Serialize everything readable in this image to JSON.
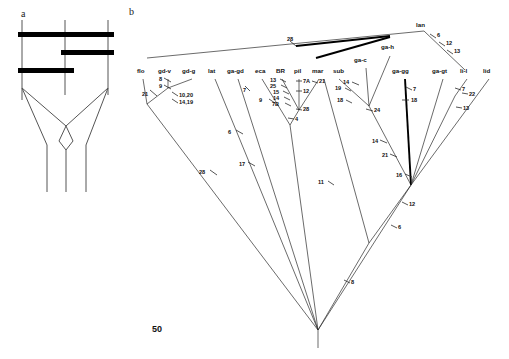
{
  "figure": {
    "panel_a_letter": "a",
    "panel_b_letter": "b",
    "scale_label": "50"
  },
  "panel_a": {
    "description": "three vertical lineage lines joined by three thick horizontal bars with crossing lines below",
    "vertical_lines": [
      {
        "name": "left-lineage",
        "x": 22,
        "y1": 20,
        "y2": 190
      },
      {
        "name": "middle-lineage",
        "x": 65,
        "y1": 20,
        "y2": 190
      },
      {
        "name": "right-lineage",
        "x": 108,
        "y1": 20,
        "y2": 190
      }
    ],
    "horizontal_bars": [
      {
        "name": "top-bar",
        "x1": 18,
        "x2": 112,
        "y": 35,
        "thickness": 6
      },
      {
        "name": "middle-bar",
        "x1": 62,
        "x2": 112,
        "y": 53,
        "thickness": 6
      },
      {
        "name": "bottom-bar",
        "x1": 18,
        "x2": 74,
        "y": 71,
        "thickness": 6
      }
    ]
  },
  "panel_b": {
    "taxa": [
      {
        "id": "flo",
        "label": "flo",
        "x": 141,
        "y": 72
      },
      {
        "id": "gd-v",
        "label": "gd-v",
        "x": 166,
        "y": 72
      },
      {
        "id": "gd-g",
        "label": "gd-g",
        "x": 190,
        "y": 72
      },
      {
        "id": "lat",
        "label": "lat",
        "x": 213,
        "y": 72
      },
      {
        "id": "ga-gd",
        "label": "ga-gd",
        "x": 236,
        "y": 72
      },
      {
        "id": "eca",
        "label": "eca",
        "x": 260,
        "y": 72
      },
      {
        "id": "BR",
        "label": "BR",
        "x": 280,
        "y": 72
      },
      {
        "id": "pil",
        "label": "pil",
        "x": 298,
        "y": 72
      },
      {
        "id": "mar",
        "label": "mar",
        "x": 317,
        "y": 72
      },
      {
        "id": "sub",
        "label": "sub",
        "x": 337,
        "y": 72
      },
      {
        "id": "ga-c",
        "label": "ga-c",
        "x": 360,
        "y": 61
      },
      {
        "id": "ga-h",
        "label": "ga-h",
        "x": 386,
        "y": 48
      },
      {
        "id": "ga-gg",
        "label": "ga-gg",
        "x": 398,
        "y": 72
      },
      {
        "id": "ga-gt",
        "label": "ga-gt",
        "x": 440,
        "y": 72
      },
      {
        "id": "li-l",
        "label": "li-l",
        "x": 465,
        "y": 72
      },
      {
        "id": "lid",
        "label": "lid",
        "x": 487,
        "y": 72
      },
      {
        "id": "lan",
        "label": "lan",
        "x": 421,
        "y": 25
      }
    ],
    "branch_values": [
      {
        "value": "21",
        "x": 146,
        "y": 94
      },
      {
        "value": "8",
        "x": 168,
        "y": 80
      },
      {
        "value": "9",
        "x": 168,
        "y": 87
      },
      {
        "value": "10,20",
        "x": 178,
        "y": 94
      },
      {
        "value": "14,19",
        "x": 178,
        "y": 101
      },
      {
        "value": "28",
        "x": 204,
        "y": 172
      },
      {
        "value": "6",
        "x": 230,
        "y": 131
      },
      {
        "value": "17",
        "x": 241,
        "y": 163
      },
      {
        "value": "7",
        "x": 242,
        "y": 85
      },
      {
        "value": "13",
        "x": 274,
        "y": 80
      },
      {
        "value": "25",
        "x": 274,
        "y": 86
      },
      {
        "value": "15",
        "x": 277,
        "y": 92
      },
      {
        "value": "14",
        "x": 277,
        "y": 98
      },
      {
        "value": "7B",
        "x": 277,
        "y": 104
      },
      {
        "value": "9",
        "x": 263,
        "y": 100
      },
      {
        "value": "7A",
        "x": 303,
        "y": 81
      },
      {
        "value": "21",
        "x": 319,
        "y": 81
      },
      {
        "value": "12",
        "x": 304,
        "y": 91
      },
      {
        "value": "28",
        "x": 302,
        "y": 109
      },
      {
        "value": "4",
        "x": 294,
        "y": 118
      },
      {
        "value": "11",
        "x": 322,
        "y": 182
      },
      {
        "value": "14",
        "x": 348,
        "y": 83
      },
      {
        "value": "19",
        "x": 339,
        "y": 88
      },
      {
        "value": "18",
        "x": 340,
        "y": 101
      },
      {
        "value": "24",
        "x": 375,
        "y": 110
      },
      {
        "value": "14",
        "x": 375,
        "y": 141
      },
      {
        "value": "21",
        "x": 385,
        "y": 155
      },
      {
        "value": "16",
        "x": 400,
        "y": 175
      },
      {
        "value": "7",
        "x": 413,
        "y": 88
      },
      {
        "value": "18",
        "x": 412,
        "y": 100
      },
      {
        "value": "7",
        "x": 462,
        "y": 88
      },
      {
        "value": "22",
        "x": 470,
        "y": 93
      },
      {
        "value": "13",
        "x": 465,
        "y": 108
      },
      {
        "value": "6",
        "x": 436,
        "y": 35
      },
      {
        "value": "12",
        "x": 445,
        "y": 43
      },
      {
        "value": "13",
        "x": 453,
        "y": 51
      },
      {
        "value": "28",
        "x": 290,
        "y": 41
      },
      {
        "value": "12",
        "x": 409,
        "y": 203
      },
      {
        "value": "6",
        "x": 398,
        "y": 226
      },
      {
        "value": "8",
        "x": 351,
        "y": 281
      }
    ]
  }
}
